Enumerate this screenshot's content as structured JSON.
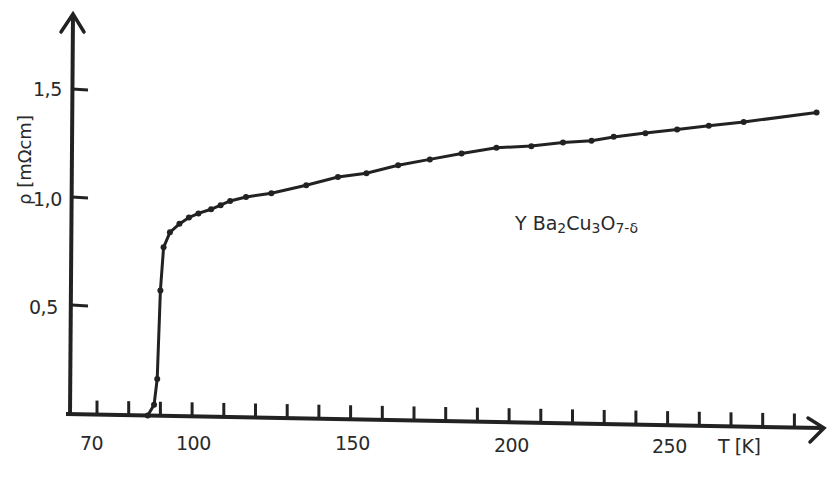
{
  "chart_data": {
    "type": "line",
    "title": "",
    "xlabel": "T [K]",
    "ylabel": "ρ [mΩcm]",
    "xlim": [
      65,
      302
    ],
    "ylim": [
      0,
      1.8
    ],
    "x_ticks": [
      70,
      100,
      150,
      200,
      250
    ],
    "x_tick_labels": [
      "70",
      "100",
      "150",
      "200",
      "250"
    ],
    "x_minor_tick_step": 10,
    "y_ticks": [
      0.5,
      1.0,
      1.5
    ],
    "y_tick_labels": [
      "0,5",
      "1,0",
      "1,5"
    ],
    "grid": false,
    "legend": null,
    "annotations": [
      {
        "text": "YBa2Cu3O7-δ",
        "x": 215,
        "y": 1.0
      }
    ],
    "series": [
      {
        "name": "YBa2Cu3O7-δ",
        "markers": true,
        "x": [
          86,
          88,
          89,
          90,
          91,
          93,
          96,
          99,
          102,
          106,
          109,
          112,
          117,
          125,
          136,
          146,
          155,
          165,
          175,
          185,
          196,
          207,
          217,
          226,
          233,
          243,
          253,
          263,
          274,
          297
        ],
        "y": [
          0.0,
          0.05,
          0.17,
          0.58,
          0.78,
          0.85,
          0.89,
          0.92,
          0.94,
          0.96,
          0.98,
          1.0,
          1.02,
          1.04,
          1.08,
          1.12,
          1.14,
          1.18,
          1.21,
          1.24,
          1.27,
          1.28,
          1.3,
          1.31,
          1.33,
          1.35,
          1.37,
          1.39,
          1.41,
          1.46
        ]
      }
    ]
  },
  "labels": {
    "y_axis": "ρ [mΩcm]",
    "x_axis": "T [K]",
    "formula_parts": {
      "a": "Y Ba",
      "s1": "2",
      "b": "Cu",
      "s2": "3",
      "c": "O",
      "s3": "7-δ"
    },
    "y_ticks": [
      "1,5",
      "1,0",
      "0,5"
    ],
    "x_ticks": [
      "70",
      "100",
      "150",
      "200",
      "250"
    ]
  },
  "colors": {
    "ink": "#222222",
    "background": "#ffffff"
  }
}
